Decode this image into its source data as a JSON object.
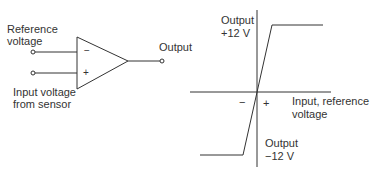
{
  "comparator": {
    "reference_label_line1": "Reference",
    "reference_label_line2": "voltage",
    "input_label_line1": "Input voltage",
    "input_label_line2": "from sensor",
    "output_label": "Output",
    "inverting_sign": "−",
    "noninverting_sign": "+"
  },
  "graph": {
    "output_pos_line1": "Output",
    "output_pos_line2": "+12 V",
    "output_neg_line1": "Output",
    "output_neg_line2": "−12 V",
    "x_label_line1": "Input, reference",
    "x_label_line2": "voltage",
    "minus_sign": "−",
    "plus_sign": "+"
  },
  "colors": {
    "line": "#333333",
    "text": "#333333",
    "background": "#ffffff"
  }
}
